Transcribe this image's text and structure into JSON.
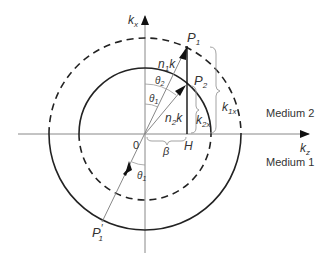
{
  "figure": {
    "type": "wave-vector refraction diagram",
    "axes": {
      "vertical": {
        "label": "k",
        "subscript": "x"
      },
      "horizontal": {
        "label": "k",
        "subscript": "z"
      }
    },
    "origin_label": "0",
    "points": {
      "P1": {
        "label": "P",
        "subscript": "1"
      },
      "P2": {
        "label": "P",
        "subscript": "2"
      },
      "P1_prime": {
        "label": "P",
        "prime": "′",
        "subscript": "1"
      },
      "H": {
        "label": "H"
      }
    },
    "vectors": {
      "n1k": {
        "label": "n",
        "subscript": "1",
        "suffix": "k"
      },
      "n2k": {
        "label": "n",
        "subscript": "2",
        "suffix": "k"
      }
    },
    "angles": {
      "theta1_upper": {
        "label": "θ",
        "subscript": "1"
      },
      "theta2": {
        "label": "θ",
        "subscript": "2"
      },
      "theta1_lower": {
        "label": "θ",
        "subscript": "1"
      }
    },
    "braces": {
      "k1x": {
        "label": "k",
        "subscript": "1x"
      },
      "k2x": {
        "label": "k",
        "subscript": "2x"
      },
      "beta": {
        "label": "β"
      }
    },
    "regions": {
      "upper": "Medium 2",
      "lower": "Medium 1"
    },
    "circles": {
      "outer_radius_label": "n1k",
      "inner_radius_label": "n2k",
      "upper_half": {
        "outer": "dashed",
        "inner": "solid"
      },
      "lower_half": {
        "outer": "solid",
        "inner": "dashed"
      }
    },
    "colors": {
      "line": "#333333",
      "axis": "#888888",
      "text": "#333333"
    }
  }
}
